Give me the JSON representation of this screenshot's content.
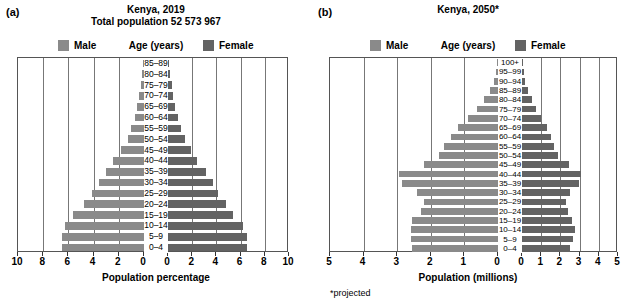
{
  "figure": {
    "panels": [
      {
        "letter": "(a)",
        "title_line1": "Kenya, 2019",
        "title_line2": "Total population 52 573 967",
        "legend": {
          "male": "Male",
          "center": "Age (years)",
          "female": "Female"
        },
        "axis_title": "Population percentage",
        "footnote": "",
        "ticks": [
          "10",
          "8",
          "6",
          "4",
          "2",
          "0",
          "0",
          "2",
          "4",
          "6",
          "8",
          "10"
        ]
      },
      {
        "letter": "(b)",
        "title_line1": "Kenya, 2050*",
        "title_line2": "",
        "legend": {
          "male": "Male",
          "center": "Age (years)",
          "female": "Female"
        },
        "axis_title": "Population (millions)",
        "footnote": "*projected",
        "ticks": [
          "5",
          "4",
          "3",
          "2",
          "1",
          "0",
          "0",
          "1",
          "2",
          "3",
          "4",
          "5"
        ]
      }
    ]
  },
  "chart_data": [
    {
      "type": "bar",
      "subtype": "population-pyramid",
      "panel": "(a)",
      "title": "Kenya, 2019",
      "subtitle": "Total population 52 573 967",
      "xlabel": "Population percentage",
      "ylabel": "Age (years)",
      "xlim": [
        -10,
        10
      ],
      "xticks": [
        10,
        8,
        6,
        4,
        2,
        0,
        0,
        2,
        4,
        6,
        8,
        10
      ],
      "grid": true,
      "legend": [
        "Male",
        "Female"
      ],
      "legend_position": "top",
      "categories": [
        "85–89",
        "80–84",
        "75–79",
        "70–74",
        "65–69",
        "60–64",
        "55–59",
        "50–54",
        "45–49",
        "40–44",
        "35–39",
        "30–34",
        "25–29",
        "20–24",
        "15–19",
        "10–14",
        "5–9",
        "0–4"
      ],
      "series": [
        {
          "name": "Male",
          "values": [
            0.1,
            0.15,
            0.25,
            0.4,
            0.55,
            0.75,
            1.0,
            1.3,
            1.8,
            2.5,
            3.0,
            3.6,
            4.1,
            4.8,
            5.6,
            6.3,
            6.5,
            6.5
          ]
        },
        {
          "name": "Female",
          "values": [
            0.1,
            0.2,
            0.3,
            0.45,
            0.6,
            0.85,
            1.1,
            1.4,
            1.9,
            2.4,
            3.1,
            3.7,
            4.1,
            4.8,
            5.4,
            6.2,
            6.5,
            6.5
          ]
        }
      ]
    },
    {
      "type": "bar",
      "subtype": "population-pyramid",
      "panel": "(b)",
      "title": "Kenya, 2050*",
      "subtitle": "",
      "xlabel": "Population (millions)",
      "ylabel": "Age (years)",
      "xlim": [
        -5,
        5
      ],
      "xticks": [
        5,
        4,
        3,
        2,
        1,
        0,
        0,
        1,
        2,
        3,
        4,
        5
      ],
      "grid": true,
      "legend": [
        "Male",
        "Female"
      ],
      "legend_position": "top",
      "note": "*projected",
      "categories": [
        "100+",
        "95–99",
        "90–94",
        "85–89",
        "80–84",
        "75–79",
        "70–74",
        "65–69",
        "60–64",
        "55–59",
        "50–54",
        "45–49",
        "40–44",
        "35–39",
        "30–34",
        "25–29",
        "20–24",
        "15–19",
        "10–14",
        "5–9",
        "0–4"
      ],
      "series": [
        {
          "name": "Male",
          "values": [
            0.02,
            0.06,
            0.13,
            0.25,
            0.42,
            0.62,
            0.9,
            1.2,
            1.4,
            1.6,
            1.75,
            2.2,
            2.95,
            2.85,
            2.4,
            2.2,
            2.3,
            2.55,
            2.6,
            2.6,
            2.55
          ]
        },
        {
          "name": "Female",
          "values": [
            0.03,
            0.09,
            0.18,
            0.33,
            0.5,
            0.72,
            1.0,
            1.3,
            1.5,
            1.65,
            1.85,
            2.45,
            3.05,
            2.95,
            2.5,
            2.3,
            2.4,
            2.6,
            2.75,
            2.65,
            2.5
          ]
        }
      ]
    }
  ],
  "colors": {
    "male": "#8a8a8a",
    "female": "#636363",
    "axis": "#555555",
    "grid": "#777777",
    "background": "#ffffff"
  }
}
